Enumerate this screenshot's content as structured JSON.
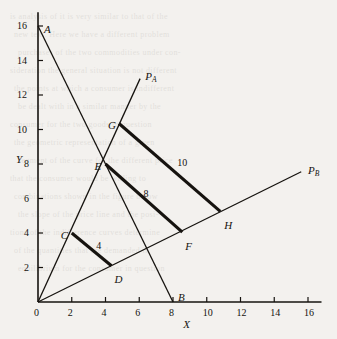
{
  "figure": {
    "background_color": "#f3f1ee",
    "ink_color": "#16130f",
    "x_axis_label": "X",
    "y_axis_label": "Y"
  },
  "chart_data": {
    "type": "line",
    "title": "",
    "xlabel": "X",
    "ylabel": "Y",
    "xlim": [
      0,
      16.8
    ],
    "ylim": [
      0,
      16.8
    ],
    "xticks": [
      0,
      2,
      4,
      6,
      8,
      10,
      12,
      14,
      16
    ],
    "yticks": [
      2,
      4,
      6,
      8,
      10,
      12,
      14,
      16
    ],
    "grid": false,
    "legend": "none",
    "points": [
      {
        "label": "A",
        "x": 0.0,
        "y": 16.0,
        "label_dx": 6,
        "label_dy": -2
      },
      {
        "label": "B",
        "x": 8.0,
        "y": 0.0,
        "label_dx": 5,
        "label_dy": -10
      },
      {
        "label": "C",
        "x": 2.0,
        "y": 4.0,
        "label_dx": -11,
        "label_dy": -3
      },
      {
        "label": "D",
        "x": 4.35,
        "y": 2.1,
        "label_dx": 3,
        "label_dy": 8
      },
      {
        "label": "E",
        "x": 4.0,
        "y": 8.0,
        "label_dx": -11,
        "label_dy": -3
      },
      {
        "label": "F",
        "x": 8.55,
        "y": 4.05,
        "label_dx": 3,
        "label_dy": 9
      },
      {
        "label": "G",
        "x": 4.8,
        "y": 10.35,
        "label_dx": -11,
        "label_dy": -3
      },
      {
        "label": "H",
        "x": 10.8,
        "y": 5.25,
        "label_dx": 4,
        "label_dy": 9
      }
    ],
    "rays": [
      {
        "name": "P_A",
        "label": "P",
        "sub": "A",
        "from": [
          0,
          0
        ],
        "to": [
          6.05,
          12.95
        ],
        "label_x": 6.35,
        "label_y": 13.4
      },
      {
        "name": "P_B",
        "label": "P",
        "sub": "B",
        "from": [
          0,
          0
        ],
        "to": [
          15.6,
          7.55
        ],
        "label_x": 16.0,
        "label_y": 7.95
      }
    ],
    "budget_line": {
      "from": [
        0,
        16
      ],
      "to": [
        8,
        0
      ]
    },
    "indifference_segments": [
      {
        "name": "CD",
        "from": [
          2.0,
          4.0
        ],
        "to": [
          4.35,
          2.1
        ],
        "value": "4",
        "label_x": 3.45,
        "label_y": 3.55
      },
      {
        "name": "EF",
        "from": [
          4.0,
          8.0
        ],
        "to": [
          8.55,
          4.05
        ],
        "value": "8",
        "label_x": 6.25,
        "label_y": 6.55
      },
      {
        "name": "GH",
        "from": [
          4.8,
          10.35
        ],
        "to": [
          10.8,
          5.25
        ],
        "value": "10",
        "label_x": 8.25,
        "label_y": 8.35
      }
    ]
  },
  "bleed_text": {
    "lines": [
      "is analysis of it is very similar to that of the",
      "new text. Here we have a different problem",
      "purchases of the two commodities under con-",
      "sideration the general situation is not different",
      "the points at which a consumer is indifferent",
      "be dealt with in a similar manner by the",
      "consumer for the two goods in question",
      "the geometric representation of a given",
      "segment of the curve for the different price",
      "that the consumer would be willing to",
      "combinations shown in the figure below",
      "the slope of the price line and the posi-",
      "tions of the indifference curves determine",
      "of the quantities that are demanded in",
      "equilibrium for the consumer in question"
    ]
  }
}
